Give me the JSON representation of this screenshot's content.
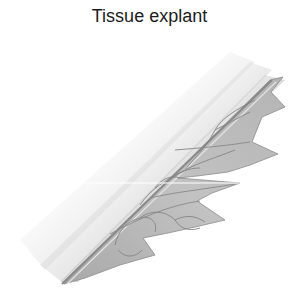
{
  "figure": {
    "title": "Tissue explant",
    "illustration": "tissue-explant-drawing",
    "colors": {
      "tissue_fill": "#b9b9b9",
      "tissue_light": "#cfcfcf",
      "vein_stroke": "#8a8a8a",
      "shadow": "#9a9a9a",
      "title_text": "#1c1c1c"
    }
  }
}
